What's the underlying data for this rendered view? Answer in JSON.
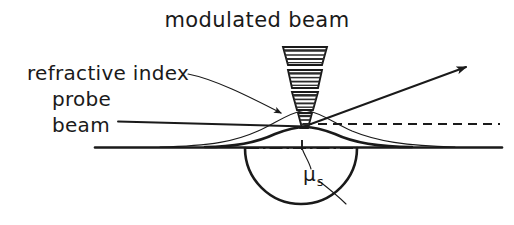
{
  "figure": {
    "domain": "diagram",
    "background_color": "#ffffff",
    "ink_color": "#1a1a1a",
    "width": 514,
    "height": 225,
    "caption_absent": true
  },
  "labels": {
    "modulated_beam": "modulated  beam",
    "refractive_index": "refractive index",
    "probe": "probe",
    "beam": "beam",
    "mu_symbol": "μ",
    "mu_subscript": "s"
  },
  "label_positions": {
    "modulated_beam": {
      "x": 257,
      "y": 27,
      "anchor": "middle"
    },
    "refractive_index": {
      "x": 27,
      "y": 80,
      "anchor": "start"
    },
    "probe": {
      "x": 52,
      "y": 106,
      "anchor": "start"
    },
    "beam": {
      "x": 52,
      "y": 132,
      "anchor": "start"
    },
    "mu": {
      "x": 303,
      "y": 181,
      "anchor": "start"
    }
  },
  "elements": {
    "modulated_beam_cone": {
      "name": "modulated-pump-beam",
      "description": "stack of four hatched trapezoid segments converging downward to a focal point at the sample surface",
      "segment_count": 4,
      "apex_x": 305,
      "focus_y": 126,
      "top_y": 47,
      "segments": [
        {
          "index": 0,
          "y_top": 47,
          "y_bottom": 65,
          "half_width_top": 22,
          "half_width_bottom": 17,
          "stripes": 4
        },
        {
          "index": 1,
          "y_top": 70,
          "y_bottom": 88,
          "half_width_top": 17,
          "half_width_bottom": 13,
          "stripes": 4
        },
        {
          "index": 2,
          "y_top": 92,
          "y_bottom": 110,
          "half_width_top": 13,
          "half_width_bottom": 8,
          "stripes": 4
        },
        {
          "index": 3,
          "y_top": 113,
          "y_bottom": 128,
          "half_width_top": 7,
          "half_width_bottom": 3,
          "stripes": 3
        }
      ]
    },
    "refractive_index_profile": {
      "name": "refractive-index-gradient-curve",
      "description": "thin bell shaped curve above the surface representing the refractive index gradient in the fluid",
      "peak_x": 305,
      "peak_y": 110,
      "left_foot_x": 160,
      "right_foot_x": 455,
      "baseline_y": 147
    },
    "surface_bulge": {
      "name": "thermoelastic-surface-bump",
      "description": "thick lower curve, the thermally expanded sample surface bump",
      "peak_x": 305,
      "peak_y": 127,
      "left_foot_x": 205,
      "right_foot_x": 412,
      "baseline_y": 147
    },
    "sample_surface": {
      "name": "sample-surface-line",
      "x_start": 95,
      "x_end": 502,
      "y": 147
    },
    "probe_beam_incoming": {
      "name": "probe-beam-incident-ray",
      "x_start": 118,
      "y_start": 121,
      "x_end": 305,
      "y_end": 126
    },
    "probe_beam_deflected": {
      "name": "probe-beam-deflected-ray",
      "x_start": 305,
      "y_start": 126,
      "x_end": 470,
      "y_end": 66,
      "arrowhead": true
    },
    "undeflected_reference": {
      "name": "undeflected-probe-reference-dashed-line",
      "style": "dashed",
      "x_start": 305,
      "x_end": 500,
      "y": 124
    },
    "thermal_hemisphere": {
      "name": "thermal-diffusion-hemisphere",
      "description": "semicircular region below the surface indicating the thermal diffusion volume of radius mu_s",
      "center_x": 301,
      "center_y": 148,
      "radius": 56,
      "orientation": "below-surface"
    },
    "hemisphere_chord": {
      "name": "hemisphere-chord-dash-dot-line",
      "style": "dash-dot",
      "x_start": 246,
      "x_end": 358,
      "y": 148
    },
    "leader_refractive_index": {
      "name": "leader-line-refractive-index",
      "from_x": 188,
      "from_y": 74,
      "to_x": 283,
      "to_y": 114,
      "arrowhead": true,
      "curved": true
    },
    "leader_mu_upper": {
      "name": "leader-line-mu-to-surface",
      "from_x": 310,
      "from_y": 168,
      "to_x": 303,
      "to_y": 148
    },
    "leader_mu_lower": {
      "name": "leader-line-mu-to-hemisphere-arc",
      "from_x": 318,
      "from_y": 180,
      "to_x": 345,
      "to_y": 203
    }
  }
}
